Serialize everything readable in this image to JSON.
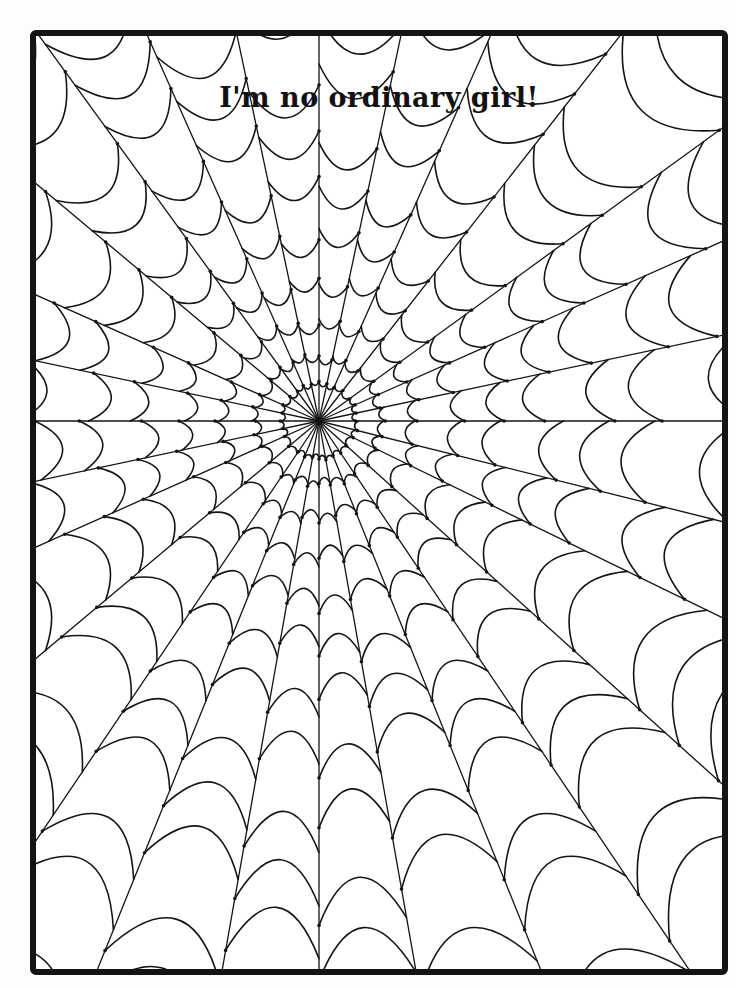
{
  "title": "I'm no ordinary girl!",
  "colors": {
    "ink": "#141414",
    "paper": "#ffffff"
  },
  "web": {
    "center": [
      283,
      385
    ],
    "radial_angles_deg": [
      0,
      12,
      24,
      36,
      52,
      66,
      78,
      90,
      102,
      114,
      126,
      140,
      156,
      168,
      180,
      192,
      204,
      220,
      236,
      248,
      260,
      270,
      280,
      292,
      304,
      318,
      334,
      346
    ],
    "ring_radii": [
      38,
      65,
      100,
      140,
      185,
      235,
      290,
      350,
      415,
      485,
      560,
      640,
      720
    ]
  }
}
